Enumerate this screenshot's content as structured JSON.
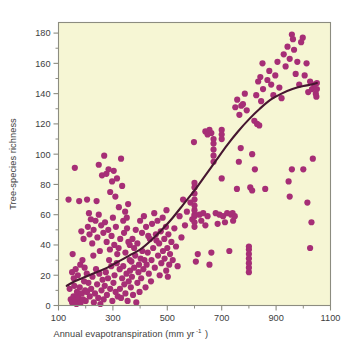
{
  "chart_data": {
    "type": "scatter",
    "title": "",
    "xlabel": "Annual evapotranspiration (mm yr -1)",
    "xlabel_main": "Annual evapotranspiration (mm yr",
    "xlabel_sup": "-1",
    "xlabel_tail": ")",
    "ylabel": "Tree-species richness",
    "xlim": [
      100,
      1100
    ],
    "ylim": [
      0,
      187
    ],
    "xticks": [
      100,
      300,
      500,
      700,
      900,
      1100
    ],
    "xtick_labels": [
      "100",
      "300",
      "500",
      "700",
      "900",
      "1100"
    ],
    "xminor_ticks": [
      200,
      400,
      600,
      800,
      1000
    ],
    "yticks": [
      0,
      20,
      40,
      60,
      80,
      100,
      120,
      140,
      160,
      180
    ],
    "ytick_labels": [
      "0",
      "20",
      "40",
      "60",
      "80",
      "100",
      "120",
      "140",
      "160",
      "180"
    ],
    "yminor_ticks": [
      10,
      30,
      50,
      70,
      90,
      110,
      130,
      150,
      170
    ],
    "grid": false,
    "legend": null,
    "plot_bg_color": "#F6F6D4",
    "point_color": "#A62E76",
    "curve_color": "#461630",
    "frame_color": "#8c8c80",
    "point_radius": 3.1,
    "series": [
      {
        "name": "Forest plots",
        "marker": "circle",
        "points": [
          [
            137,
            70
          ],
          [
            152,
            34
          ],
          [
            160,
            91
          ],
          [
            168,
            9
          ],
          [
            176,
            69
          ],
          [
            141,
            11
          ],
          [
            145,
            4
          ],
          [
            150,
            2
          ],
          [
            155,
            6
          ],
          [
            158,
            13
          ],
          [
            162,
            3
          ],
          [
            166,
            1
          ],
          [
            170,
            7
          ],
          [
            174,
            5
          ],
          [
            178,
            12
          ],
          [
            182,
            2
          ],
          [
            186,
            8
          ],
          [
            190,
            4
          ],
          [
            194,
            16
          ],
          [
            198,
            10
          ],
          [
            150,
            22
          ],
          [
            156,
            18
          ],
          [
            163,
            24
          ],
          [
            171,
            20
          ],
          [
            180,
            27
          ],
          [
            188,
            30
          ],
          [
            196,
            25
          ],
          [
            204,
            21
          ],
          [
            184,
            49
          ],
          [
            192,
            44
          ],
          [
            200,
            3
          ],
          [
            205,
            9
          ],
          [
            210,
            15
          ],
          [
            215,
            6
          ],
          [
            220,
            11
          ],
          [
            225,
            19
          ],
          [
            230,
            2
          ],
          [
            234,
            8
          ],
          [
            238,
            24
          ],
          [
            242,
            14
          ],
          [
            246,
            5
          ],
          [
            250,
            21
          ],
          [
            254,
            1
          ],
          [
            258,
            10
          ],
          [
            262,
            17
          ],
          [
            208,
            52
          ],
          [
            214,
            47
          ],
          [
            219,
            57
          ],
          [
            224,
            41
          ],
          [
            229,
            50
          ],
          [
            236,
            56
          ],
          [
            243,
            45
          ],
          [
            248,
            60
          ],
          [
            252,
            36
          ],
          [
            257,
            53
          ],
          [
            205,
            70
          ],
          [
            212,
            61
          ],
          [
            228,
            33
          ],
          [
            240,
            69
          ],
          [
            248,
            93
          ],
          [
            260,
            86
          ],
          [
            266,
            4
          ],
          [
            270,
            13
          ],
          [
            274,
            22
          ],
          [
            278,
            7
          ],
          [
            282,
            18
          ],
          [
            286,
            30
          ],
          [
            290,
            11
          ],
          [
            294,
            26
          ],
          [
            298,
            3
          ],
          [
            302,
            15
          ],
          [
            306,
            20
          ],
          [
            310,
            9
          ],
          [
            314,
            28
          ],
          [
            318,
            6
          ],
          [
            265,
            48
          ],
          [
            271,
            55
          ],
          [
            277,
            42
          ],
          [
            283,
            50
          ],
          [
            289,
            37
          ],
          [
            295,
            46
          ],
          [
            300,
            58
          ],
          [
            305,
            40
          ],
          [
            311,
            52
          ],
          [
            316,
            34
          ],
          [
            268,
            99
          ],
          [
            276,
            87
          ],
          [
            284,
            90
          ],
          [
            290,
            75
          ],
          [
            297,
            82
          ],
          [
            303,
            89
          ],
          [
            309,
            72
          ],
          [
            315,
            84
          ],
          [
            321,
            38
          ],
          [
            325,
            24
          ],
          [
            322,
            65
          ],
          [
            327,
            44
          ],
          [
            330,
            97
          ],
          [
            334,
            79
          ],
          [
            338,
            56
          ],
          [
            326,
            11
          ],
          [
            330,
            5
          ],
          [
            334,
            18
          ],
          [
            338,
            26
          ],
          [
            342,
            14
          ],
          [
            346,
            8
          ],
          [
            350,
            21
          ],
          [
            354,
            3
          ],
          [
            358,
            16
          ],
          [
            362,
            30
          ],
          [
            341,
            48
          ],
          [
            346,
            35
          ],
          [
            352,
            51
          ],
          [
            357,
            42
          ],
          [
            363,
            23
          ],
          [
            345,
            62
          ],
          [
            351,
            58
          ],
          [
            356,
            67
          ],
          [
            362,
            40
          ],
          [
            368,
            29
          ],
          [
            366,
            12
          ],
          [
            370,
            19
          ],
          [
            374,
            7
          ],
          [
            378,
            25
          ],
          [
            382,
            33
          ],
          [
            386,
            2
          ],
          [
            390,
            15
          ],
          [
            394,
            22
          ],
          [
            398,
            9
          ],
          [
            402,
            31
          ],
          [
            372,
            44
          ],
          [
            378,
            38
          ],
          [
            384,
            50
          ],
          [
            390,
            41
          ],
          [
            396,
            27
          ],
          [
            404,
            18
          ],
          [
            408,
            36
          ],
          [
            412,
            24
          ],
          [
            416,
            30
          ],
          [
            420,
            12
          ],
          [
            424,
            27
          ],
          [
            428,
            35
          ],
          [
            432,
            21
          ],
          [
            436,
            44
          ],
          [
            440,
            16
          ],
          [
            400,
            56
          ],
          [
            407,
            48
          ],
          [
            414,
            59
          ],
          [
            422,
            52
          ],
          [
            430,
            46
          ],
          [
            442,
            30
          ],
          [
            448,
            38
          ],
          [
            454,
            25
          ],
          [
            460,
            43
          ],
          [
            466,
            33
          ],
          [
            444,
            54
          ],
          [
            452,
            61
          ],
          [
            458,
            47
          ],
          [
            464,
            56
          ],
          [
            470,
            41
          ],
          [
            472,
            20
          ],
          [
            478,
            28
          ],
          [
            484,
            36
          ],
          [
            490,
            31
          ],
          [
            496,
            23
          ],
          [
            476,
            49
          ],
          [
            483,
            58
          ],
          [
            489,
            44
          ],
          [
            495,
            52
          ],
          [
            500,
            38
          ],
          [
            502,
            19
          ],
          [
            507,
            27
          ],
          [
            497,
            63
          ],
          [
            504,
            47
          ],
          [
            510,
            34
          ],
          [
            515,
            42
          ],
          [
            520,
            30
          ],
          [
            526,
            51
          ],
          [
            532,
            39
          ],
          [
            538,
            26
          ],
          [
            545,
            59
          ],
          [
            552,
            45
          ],
          [
            558,
            70
          ],
          [
            565,
            53
          ],
          [
            572,
            62
          ],
          [
            585,
            68
          ],
          [
            592,
            57
          ],
          [
            598,
            108
          ],
          [
            600,
            59
          ],
          [
            600,
            55
          ],
          [
            600,
            52
          ],
          [
            600,
            60
          ],
          [
            600,
            63
          ],
          [
            600,
            66
          ],
          [
            600,
            70
          ],
          [
            600,
            74
          ],
          [
            600,
            78
          ],
          [
            600,
            81
          ],
          [
            605,
            29
          ],
          [
            612,
            34
          ],
          [
            618,
            60
          ],
          [
            625,
            56
          ],
          [
            632,
            61
          ],
          [
            640,
            53
          ],
          [
            648,
            59
          ],
          [
            655,
            27
          ],
          [
            662,
            35
          ],
          [
            640,
            115
          ],
          [
            648,
            113
          ],
          [
            655,
            116
          ],
          [
            662,
            114
          ],
          [
            670,
            95
          ],
          [
            670,
            99
          ],
          [
            670,
            103
          ],
          [
            670,
            107
          ],
          [
            670,
            110
          ],
          [
            678,
            61
          ],
          [
            685,
            54
          ],
          [
            692,
            60
          ],
          [
            700,
            84
          ],
          [
            700,
            113
          ],
          [
            700,
            116
          ],
          [
            700,
            110
          ],
          [
            705,
            59
          ],
          [
            712,
            55
          ],
          [
            720,
            61
          ],
          [
            728,
            36
          ],
          [
            735,
            60
          ],
          [
            742,
            56
          ],
          [
            750,
            131
          ],
          [
            757,
            136
          ],
          [
            765,
            126
          ],
          [
            772,
            132
          ],
          [
            740,
            61
          ],
          [
            748,
            59
          ],
          [
            756,
            77
          ],
          [
            763,
            95
          ],
          [
            770,
            104
          ],
          [
            778,
            133
          ],
          [
            785,
            140
          ],
          [
            792,
            129
          ],
          [
            800,
            22
          ],
          [
            800,
            25
          ],
          [
            800,
            28
          ],
          [
            800,
            31
          ],
          [
            800,
            34
          ],
          [
            800,
            37
          ],
          [
            800,
            39
          ],
          [
            805,
            78
          ],
          [
            812,
            76
          ],
          [
            820,
            122
          ],
          [
            827,
            139
          ],
          [
            834,
            148
          ],
          [
            842,
            151
          ],
          [
            850,
            160
          ],
          [
            812,
            100
          ],
          [
            822,
            90
          ],
          [
            830,
            120
          ],
          [
            838,
            119
          ],
          [
            845,
            135
          ],
          [
            852,
            143
          ],
          [
            860,
            77
          ],
          [
            868,
            149
          ],
          [
            875,
            155
          ],
          [
            882,
            146
          ],
          [
            890,
            139
          ],
          [
            897,
            152
          ],
          [
            905,
            161
          ],
          [
            912,
            144
          ],
          [
            920,
            137
          ],
          [
            928,
            166
          ],
          [
            935,
            158
          ],
          [
            942,
            171
          ],
          [
            950,
            163
          ],
          [
            958,
            179
          ],
          [
            962,
            176
          ],
          [
            966,
            169
          ],
          [
            950,
            72
          ],
          [
            958,
            90
          ],
          [
            946,
            82
          ],
          [
            972,
            153
          ],
          [
            978,
            161
          ],
          [
            985,
            146
          ],
          [
            992,
            174
          ],
          [
            998,
            177
          ],
          [
            1005,
            152
          ],
          [
            1012,
            160
          ],
          [
            1018,
            141
          ],
          [
            1025,
            148
          ],
          [
            1032,
            143
          ],
          [
            1040,
            146
          ],
          [
            1046,
            140
          ],
          [
            1050,
            147
          ],
          [
            1050,
            143
          ],
          [
            1048,
            138
          ],
          [
            1015,
            68
          ],
          [
            1025,
            38
          ],
          [
            1030,
            55
          ],
          [
            1035,
            97
          ],
          [
            1000,
            90
          ]
        ]
      }
    ],
    "fit_curve": {
      "name": "Fitted regression curve",
      "points": [
        [
          130,
          13
        ],
        [
          160,
          16
        ],
        [
          200,
          19
        ],
        [
          240,
          22
        ],
        [
          280,
          25
        ],
        [
          320,
          29
        ],
        [
          360,
          33
        ],
        [
          400,
          37
        ],
        [
          440,
          43
        ],
        [
          480,
          50
        ],
        [
          520,
          58
        ],
        [
          560,
          67
        ],
        [
          600,
          76
        ],
        [
          640,
          86
        ],
        [
          680,
          96
        ],
        [
          720,
          106
        ],
        [
          760,
          115
        ],
        [
          800,
          123
        ],
        [
          840,
          130
        ],
        [
          880,
          136
        ],
        [
          920,
          140
        ],
        [
          960,
          143
        ],
        [
          1000,
          145
        ],
        [
          1030,
          146
        ],
        [
          1050,
          147
        ]
      ]
    }
  }
}
